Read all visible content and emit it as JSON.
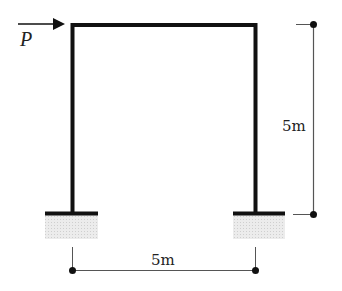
{
  "diagram": {
    "type": "portal-frame",
    "load": {
      "label": "P",
      "direction": "right",
      "applied_at": "top-left-joint"
    },
    "dimensions": {
      "height": {
        "label": "5m"
      },
      "span": {
        "label": "5m"
      }
    },
    "supports": [
      {
        "position": "left-base",
        "type": "fixed"
      },
      {
        "position": "right-base",
        "type": "fixed"
      }
    ],
    "colors": {
      "member": "#111111",
      "dimension_line": "#555555",
      "ground_hatch": "#d9d9d9"
    }
  }
}
